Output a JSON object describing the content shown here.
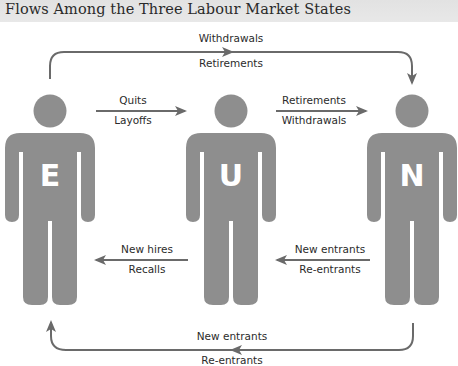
{
  "title": "Flows Among the Three Labour Market States",
  "colors": {
    "figure": "#8e8e8e",
    "arrow": "#6a6a6a",
    "title_bg": "#e4e4e4",
    "letter": "#ffffff"
  },
  "states": [
    {
      "id": "E",
      "letter": "E",
      "meaning": "Employed"
    },
    {
      "id": "U",
      "letter": "U",
      "meaning": "Unemployed"
    },
    {
      "id": "N",
      "letter": "N",
      "meaning": "Not in labour force"
    }
  ],
  "flows": {
    "e_to_n": {
      "above": "Withdrawals",
      "below": "Retirements"
    },
    "e_to_u": {
      "above": "Quits",
      "below": "Layoffs"
    },
    "u_to_n": {
      "above": "Retirements",
      "below": "Withdrawals"
    },
    "u_to_e": {
      "above": "New hires",
      "below": "Recalls"
    },
    "n_to_u": {
      "above": "New entrants",
      "below": "Re-entrants"
    },
    "n_to_e": {
      "above": "New entrants",
      "below": "Re-entrants"
    }
  }
}
